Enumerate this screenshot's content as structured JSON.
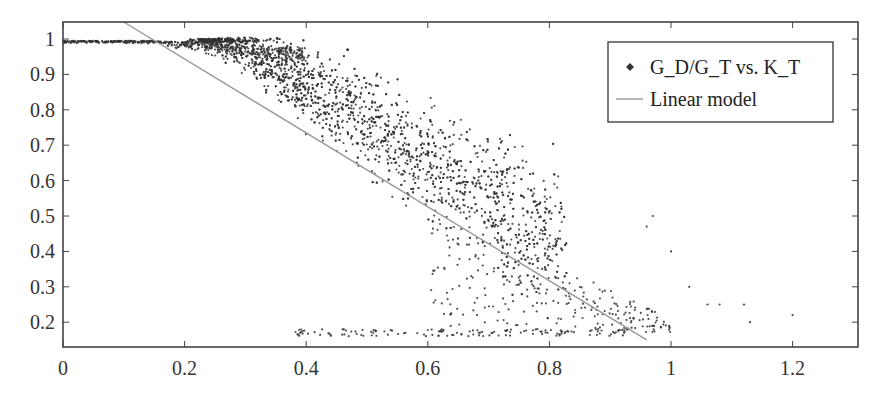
{
  "chart_data": {
    "type": "scatter",
    "title": "",
    "xlabel": "",
    "ylabel": "",
    "xlim": [
      0,
      1.3
    ],
    "ylim": [
      0.15,
      1.05
    ],
    "x_ticks": [
      0,
      0.2,
      0.4,
      0.6,
      0.8,
      1,
      1.2
    ],
    "x_tick_labels": [
      "0",
      "0.2",
      "0.4",
      "0.6",
      "0.8",
      "1",
      "1.2"
    ],
    "y_ticks": [
      0.2,
      0.3,
      0.4,
      0.5,
      0.6,
      0.7,
      0.8,
      0.9,
      1
    ],
    "y_tick_labels": [
      "0.2",
      "0.3",
      "0.4",
      "0.5",
      "0.6",
      "0.7",
      "0.8",
      "0.9",
      "1"
    ],
    "grid": false,
    "legend_position": "upper right",
    "legend": [
      {
        "label": "G_D/G_T vs. K_T",
        "marker": "diamond",
        "color": "#333333"
      },
      {
        "label": "Linear model",
        "marker": "line",
        "color": "#999999"
      }
    ],
    "series": [
      {
        "name": "G_D/G_T vs. K_T",
        "kind": "scatter",
        "description": "Dense cloud of ~3000 points; near 1.0 for K_T < 0.2, spreading and decreasing for larger K_T",
        "density_profile": [
          {
            "x_range": [
              0.0,
              0.15
            ],
            "y_center": 0.99,
            "y_spread": 0.01
          },
          {
            "x_range": [
              0.15,
              0.3
            ],
            "y_center": 0.95,
            "y_spread": 0.06
          },
          {
            "x_range": [
              0.3,
              0.4
            ],
            "y_center": 0.85,
            "y_spread": 0.15
          },
          {
            "x_range": [
              0.4,
              0.5
            ],
            "y_center": 0.7,
            "y_spread": 0.25
          },
          {
            "x_range": [
              0.5,
              0.6
            ],
            "y_center": 0.55,
            "y_spread": 0.25
          },
          {
            "x_range": [
              0.6,
              0.7
            ],
            "y_center": 0.45,
            "y_spread": 0.25
          },
          {
            "x_range": [
              0.7,
              0.8
            ],
            "y_center": 0.4,
            "y_spread": 0.25
          },
          {
            "x_range": [
              0.8,
              1.0
            ],
            "y_center": 0.4,
            "y_spread": 0.25
          }
        ],
        "outliers": [
          {
            "x": 1.0,
            "y": 0.4
          },
          {
            "x": 1.03,
            "y": 0.3
          },
          {
            "x": 1.06,
            "y": 0.25
          },
          {
            "x": 1.08,
            "y": 0.25
          },
          {
            "x": 1.12,
            "y": 0.25
          },
          {
            "x": 1.13,
            "y": 0.2
          },
          {
            "x": 1.2,
            "y": 0.22
          },
          {
            "x": 0.97,
            "y": 0.5
          },
          {
            "x": 0.96,
            "y": 0.47
          }
        ],
        "color": "#333333"
      },
      {
        "name": "Linear model",
        "kind": "line",
        "points": [
          {
            "x": 0.1,
            "y": 1.05
          },
          {
            "x": 0.96,
            "y": 0.15
          }
        ],
        "slope": -1.05,
        "intercept": 1.155,
        "color": "#999999"
      }
    ]
  }
}
